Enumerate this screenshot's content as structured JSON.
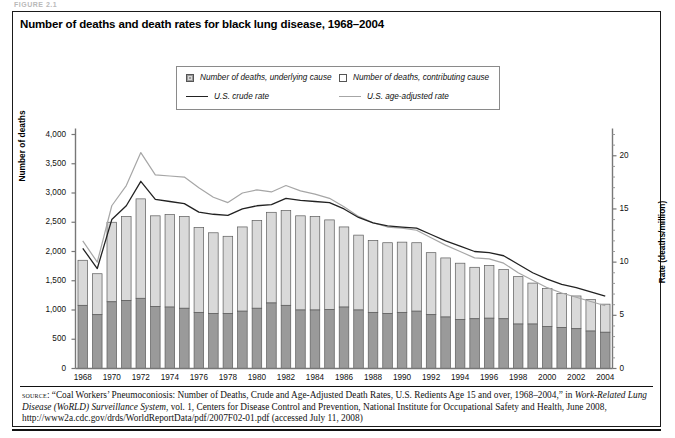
{
  "figure_label": "FIGURE 2.1",
  "title": "Number of deaths and death rates for black lung disease, 1968–2004",
  "legend": {
    "items": [
      {
        "key": "underlying",
        "label": "Number of deaths, underlying cause",
        "marker": "swatch-dark",
        "color": "#9a9a9a"
      },
      {
        "key": "contributing",
        "label": "Number of deaths, contributing cause",
        "marker": "swatch-light",
        "color": "#d9d9d9"
      },
      {
        "key": "crude",
        "label": "U.S. crude rate",
        "marker": "line-dark",
        "color": "#222222"
      },
      {
        "key": "ageadj",
        "label": "U.S. age-adjusted rate",
        "marker": "line-grey",
        "color": "#a6a6a6"
      }
    ]
  },
  "axes": {
    "left": {
      "label": "Number of deaths",
      "ticks": [
        "0",
        "500",
        "1,000",
        "1,500",
        "2,000",
        "2,500",
        "3,000",
        "3,500",
        "4,000"
      ],
      "min": 0,
      "max": 4000
    },
    "right": {
      "label": "Rate (deaths/million)",
      "ticks": [
        "0",
        "5",
        "10",
        "15",
        "20"
      ],
      "min": 0,
      "max": 22
    },
    "bottom": {
      "ticks": [
        "1968",
        "1970",
        "1972",
        "1974",
        "1976",
        "1978",
        "1980",
        "1982",
        "1984",
        "1986",
        "1988",
        "1990",
        "1992",
        "1994",
        "1996",
        "1998",
        "2000",
        "2002",
        "2004"
      ]
    }
  },
  "source": {
    "prefix": "source",
    "text_1": ": “Coal Workers’ Pneumoconiosis: Number of Deaths, Crude and Age-Adjusted Death Rates, U.S. Redients Age 15 and over, 1968–2004,” in ",
    "italic_1": "Work-Related Lung Disease (WoRLD) Surveillance System",
    "text_2": ", vol. 1, Centers for Disease Control and Prevention, National Institute for Occupational Safety and Health, June 2008, http://www2a.cdc.gov/drds/WorldReportData/pdf/2007F02-01.pdf (accessed July 11, 2008)"
  },
  "chart_data": {
    "type": "bar",
    "title": "Number of deaths and death rates for black lung disease, 1968–2004",
    "xlabel": "",
    "ylabel": "Number of deaths",
    "y2label": "Rate (deaths/million)",
    "ylim": [
      0,
      4000
    ],
    "y2lim": [
      0,
      22
    ],
    "grid": false,
    "legend_position": "top-center",
    "stacked": true,
    "categories": [
      1968,
      1969,
      1970,
      1971,
      1972,
      1973,
      1974,
      1975,
      1976,
      1977,
      1978,
      1979,
      1980,
      1981,
      1982,
      1983,
      1984,
      1985,
      1986,
      1987,
      1988,
      1989,
      1990,
      1991,
      1992,
      1993,
      1994,
      1995,
      1996,
      1997,
      1998,
      1999,
      2000,
      2001,
      2002,
      2003,
      2004
    ],
    "series": [
      {
        "name": "Number of deaths, underlying cause",
        "axis": "left",
        "type": "bar",
        "color": "#9a9a9a",
        "values": [
          1080,
          920,
          1140,
          1160,
          1200,
          1060,
          1050,
          1030,
          960,
          940,
          940,
          980,
          1030,
          1120,
          1080,
          1000,
          1000,
          1010,
          1050,
          1000,
          960,
          940,
          960,
          980,
          920,
          880,
          840,
          850,
          860,
          850,
          760,
          760,
          720,
          700,
          680,
          640,
          620
        ]
      },
      {
        "name": "Number of deaths, contributing cause",
        "axis": "left",
        "type": "bar",
        "color": "#d9d9d9",
        "values": [
          770,
          700,
          1360,
          1440,
          1700,
          1550,
          1580,
          1570,
          1450,
          1380,
          1320,
          1440,
          1500,
          1550,
          1620,
          1610,
          1600,
          1530,
          1370,
          1280,
          1230,
          1210,
          1200,
          1170,
          1060,
          1010,
          960,
          880,
          900,
          840,
          810,
          700,
          650,
          580,
          560,
          540,
          480
        ]
      },
      {
        "name": "Total deaths (stacked height)",
        "axis": "left",
        "type": "bar-total",
        "color": "#d9d9d9",
        "values": [
          1850,
          1620,
          2500,
          2600,
          2900,
          2610,
          2630,
          2600,
          2410,
          2320,
          2260,
          2420,
          2530,
          2670,
          2700,
          2610,
          2600,
          2540,
          2420,
          2280,
          2190,
          2150,
          2160,
          2150,
          1980,
          1890,
          1800,
          1730,
          1760,
          1690,
          1570,
          1460,
          1370,
          1280,
          1240,
          1180,
          1100
        ]
      },
      {
        "name": "U.S. crude rate",
        "axis": "right",
        "type": "line",
        "color": "#222222",
        "values": [
          11.3,
          9.4,
          14.0,
          15.3,
          17.6,
          15.9,
          15.7,
          15.5,
          14.7,
          14.5,
          14.4,
          15.0,
          15.3,
          15.4,
          16.0,
          15.8,
          15.7,
          15.6,
          15.0,
          14.2,
          13.7,
          13.4,
          13.3,
          13.2,
          12.6,
          12.0,
          11.5,
          11.0,
          10.9,
          10.6,
          9.8,
          9.0,
          8.4,
          7.9,
          7.6,
          7.2,
          6.8
        ]
      },
      {
        "name": "U.S. age-adjusted rate",
        "axis": "right",
        "type": "line",
        "color": "#a6a6a6",
        "values": [
          12.0,
          10.0,
          15.3,
          17.2,
          20.3,
          18.2,
          18.1,
          18.0,
          17.0,
          16.1,
          15.6,
          16.5,
          16.8,
          16.6,
          17.2,
          16.7,
          16.4,
          16.0,
          15.2,
          14.3,
          13.7,
          13.3,
          13.2,
          13.0,
          12.3,
          11.6,
          11.0,
          10.4,
          10.3,
          9.9,
          9.0,
          8.3,
          7.6,
          7.1,
          6.7,
          6.3,
          5.9
        ]
      }
    ]
  }
}
